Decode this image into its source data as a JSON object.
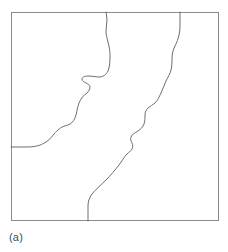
{
  "figure": {
    "caption_label": "(a)",
    "panel": {
      "x": 11,
      "y": 12,
      "width": 208,
      "height": 209,
      "border_color": "#8b8b8f",
      "fill_color": "#ffffff",
      "border_width": 1
    },
    "curve_color": "#6e6e73",
    "curve_width": 1,
    "background_color": "#ffffff",
    "caption_color": "#4a4a4e",
    "curves": [
      {
        "name": "left-boundary-curve",
        "start_edge": "left",
        "end_edge": "top",
        "start_point": [
          11,
          147
        ],
        "end_point": [
          106,
          12
        ],
        "path": "M 11 147 L 26 147 C 34 147 40 146 46 142 C 52 138 54 133 58 130 C 61 127 64 126 68 125 C 71 124 73 122 75 118 C 77 113 77 108 79 103 C 81 98 84 95 87 93 C 89 91 90 89 90 87 C 90 85 88 84 86 83 C 84 82 82 81 82 79 C 82 77 85 76 88 76 C 92 76 96 77 99 77 C 103 77 106 75 108 71 C 110 66 110 60 110 55 C 110 50 109 46 108 42 C 107 38 106 35 106 31 C 106 27 107 23 107 19 L 106 12"
      },
      {
        "name": "right-boundary-curve",
        "start_edge": "bottom",
        "end_edge": "top",
        "start_point": [
          88,
          221
        ],
        "end_point": [
          180,
          12
        ],
        "path": "M 88 221 L 88 206 C 88 202 89 198 92 194 C 96 189 101 185 106 180 C 111 175 115 170 119 165 C 122 161 124 157 127 154 C 129 152 131 151 132 149 C 133 147 133 145 132 143 C 131 141 130 139 131 137 C 132 134 135 133 138 131 C 141 129 143 127 144 124 C 145 121 145 118 145 115 C 145 112 146 110 148 108 C 150 106 153 105 155 103 C 158 100 159 97 161 93 C 163 89 164 85 166 81 C 168 77 170 74 171 70 C 172 66 172 62 172 58 C 172 54 173 50 175 46 C 177 42 178 39 179 35 C 180 31 180 27 180 23 L 180 12"
      }
    ]
  }
}
